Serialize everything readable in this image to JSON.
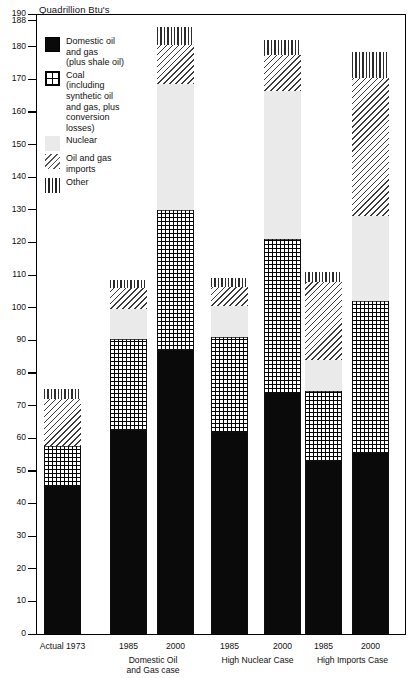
{
  "chart_data": {
    "type": "bar",
    "stacked": true,
    "title": "",
    "ylabel": "Quadrillion Btu's",
    "xlabel": "",
    "ylim": [
      0,
      190
    ],
    "grid": false,
    "legend_position": "inside-top-left",
    "y_ticks": [
      0,
      10,
      20,
      30,
      40,
      50,
      60,
      70,
      80,
      90,
      100,
      110,
      120,
      130,
      140,
      150,
      160,
      170,
      180,
      188,
      190
    ],
    "series": [
      {
        "name": "Domestic oil and gas (plus shale oil)",
        "key": "domestic",
        "values": [
          45.5,
          62.5,
          87.0,
          62.0,
          74.0,
          53.0,
          55.5
        ]
      },
      {
        "name": "Coal (including synthetic oil and gas, plus conversion losses)",
        "key": "coal",
        "values": [
          12.0,
          28.0,
          43.0,
          29.0,
          47.0,
          21.5,
          46.5
        ]
      },
      {
        "name": "Nuclear",
        "key": "nuclear",
        "values": [
          0.0,
          9.0,
          38.5,
          9.5,
          45.5,
          9.5,
          26.0
        ]
      },
      {
        "name": "Oil and gas imports",
        "key": "imports",
        "values": [
          14.5,
          6.5,
          12.0,
          6.0,
          11.0,
          24.0,
          42.5
        ]
      },
      {
        "name": "Other",
        "key": "other",
        "values": [
          3.0,
          2.5,
          5.5,
          2.5,
          4.5,
          3.0,
          8.0
        ]
      }
    ],
    "categories": [
      "Actual 1973",
      "1985",
      "2000",
      "1985",
      "2000",
      "1985",
      "2000"
    ],
    "group_labels": [
      "",
      "Domestic Oil and Gas case",
      "High Nuclear Case",
      "High Imports Case"
    ],
    "totals": [
      75.0,
      108.5,
      186.0,
      109.0,
      182.0,
      111.0,
      178.5
    ]
  },
  "axis": {
    "title": "Quadrillion Btu's",
    "ticks": [
      {
        "value": 190,
        "label": "190"
      },
      {
        "value": 188,
        "label": "188"
      },
      {
        "value": 180,
        "label": "180"
      },
      {
        "value": 170,
        "label": "170"
      },
      {
        "value": 160,
        "label": "160"
      },
      {
        "value": 150,
        "label": "150"
      },
      {
        "value": 140,
        "label": "140"
      },
      {
        "value": 130,
        "label": "130"
      },
      {
        "value": 120,
        "label": "120"
      },
      {
        "value": 110,
        "label": "110"
      },
      {
        "value": 100,
        "label": "100"
      },
      {
        "value": 90,
        "label": "90"
      },
      {
        "value": 80,
        "label": "80"
      },
      {
        "value": 70,
        "label": "70"
      },
      {
        "value": 60,
        "label": "60"
      },
      {
        "value": 50,
        "label": "50"
      },
      {
        "value": 40,
        "label": "40"
      },
      {
        "value": 30,
        "label": "30"
      },
      {
        "value": 20,
        "label": "20"
      },
      {
        "value": 10,
        "label": "10"
      },
      {
        "value": 0,
        "label": "0"
      }
    ]
  },
  "legend": {
    "items": [
      {
        "key": "domestic",
        "label": "Domestic oil\nand gas\n(plus shale oil)",
        "swatch": "solid-black-swatch"
      },
      {
        "key": "coal",
        "label": "Coal\n(including\nsynthetic oil\nand gas, plus\nconversion\nlosses)",
        "swatch": "crosshatch-grid-swatch"
      },
      {
        "key": "nuclear",
        "label": "Nuclear",
        "swatch": "light-gray-swatch"
      },
      {
        "key": "imports",
        "label": "Oil and gas\nimports",
        "swatch": "diagonal-hatch-swatch"
      },
      {
        "key": "other",
        "label": "Other",
        "swatch": "vertical-stripe-swatch"
      }
    ]
  },
  "x_axis": {
    "year_labels": [
      {
        "text": "Actual 1973",
        "bar": 0
      },
      {
        "text": "1985",
        "bar": 1
      },
      {
        "text": "2000",
        "bar": 2
      },
      {
        "text": "1985",
        "bar": 3
      },
      {
        "text": "2000",
        "bar": 4
      },
      {
        "text": "1985",
        "bar": 5
      },
      {
        "text": "2000",
        "bar": 6
      }
    ],
    "group_labels": [
      {
        "text": "Domestic Oil\nand Gas case"
      },
      {
        "text": "High Nuclear Case"
      },
      {
        "text": "High Imports Case"
      }
    ]
  },
  "colors": {
    "domestic": "#0a0a0a",
    "coal": "#000000",
    "nuclear": "#eaeaea",
    "imports": "#3a3a3a",
    "other": "#2b2b2b",
    "axis": "#000000",
    "background": "#ffffff"
  }
}
